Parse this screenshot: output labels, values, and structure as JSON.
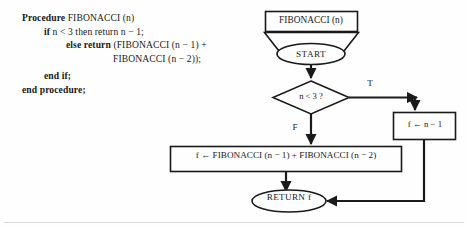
{
  "figure": {
    "caption_free": true,
    "background_color": "#fefefe",
    "ink_color": "#1a1a1a"
  },
  "pseudocode": {
    "lines": [
      {
        "keyword": "Procedure",
        "rest": " FIBONACCI (n)",
        "indent": 0
      },
      {
        "keyword": "if",
        "rest": " n < 3 then return n − 1;",
        "indent": 1
      },
      {
        "keyword": "else return",
        "rest": " (FIBONACCI (n − 1) +",
        "indent": 2
      },
      {
        "keyword": "",
        "rest": "FIBONACCI (n − 2));",
        "indent": 3
      },
      {
        "keyword": "end if;",
        "rest": "",
        "indent": 1
      },
      {
        "keyword": "end procedure;",
        "rest": "",
        "indent": 0
      }
    ],
    "line_1_keyword": "Procedure",
    "line_1_rest": " FIBONACCI (n)",
    "line_2_keyword": "if",
    "line_2_rest": " n < 3 then return n − 1;",
    "line_3_keyword": "else return",
    "line_3_rest": " (FIBONACCI (n − 1) +",
    "line_4_rest": "FIBONACCI (n − 2));",
    "line_5_keyword": "end if;",
    "line_6_keyword": "end procedure;"
  },
  "flowchart": {
    "header_box_label": "FIBONACCI (n)",
    "start_terminator_label": "START",
    "decision_label": "n < 3 ?",
    "true_branch_label": "T",
    "false_branch_label": "F",
    "true_process_label": "f ← n − 1",
    "false_process_label": "f ← FIBONACCI (n − 1) + FIBONACCI (n − 2)",
    "return_terminator_label": "RETURN f"
  }
}
